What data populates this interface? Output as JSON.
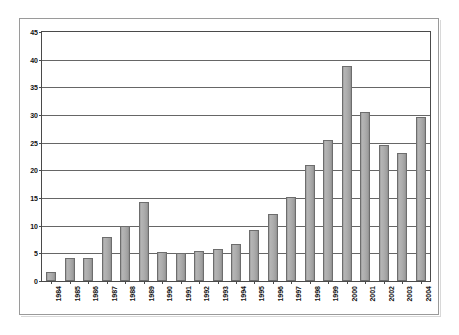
{
  "chart_data": {
    "type": "bar",
    "title": "",
    "subtitle": "",
    "xlabel": "",
    "ylabel": "",
    "categories": [
      "1984",
      "1985",
      "1986",
      "1987",
      "1988",
      "1989",
      "1990",
      "1991",
      "1992",
      "1993",
      "1994",
      "1995",
      "1996",
      "1997",
      "1998",
      "1999",
      "2000",
      "2001",
      "2002",
      "2003",
      "2004"
    ],
    "values": [
      1.6,
      4.2,
      4.1,
      7.9,
      10.0,
      14.2,
      5.2,
      5.0,
      5.5,
      5.7,
      6.6,
      9.2,
      12.1,
      15.1,
      21.0,
      25.5,
      38.9,
      30.6,
      24.6,
      23.2,
      29.7
    ],
    "ylim": [
      0,
      45
    ],
    "ytick_values": [
      0,
      5,
      10,
      15,
      20,
      25,
      30,
      35,
      40,
      45
    ],
    "ytick_labels": [
      "0",
      "5",
      "10",
      "15",
      "20",
      "25",
      "30",
      "35",
      "40",
      "45"
    ],
    "grid": true,
    "grid_axis": "y",
    "legend": false,
    "legend_position": "none",
    "series": [
      {
        "name": "",
        "values": [
          1.6,
          4.2,
          4.1,
          7.9,
          10.0,
          14.2,
          5.2,
          5.0,
          5.5,
          5.7,
          6.6,
          9.2,
          12.1,
          15.1,
          21.0,
          25.5,
          38.9,
          30.6,
          24.6,
          23.2,
          29.7
        ]
      }
    ],
    "colors": {
      "bar_fill": "#adadad",
      "bar_border": "#6d6d6d",
      "gridline": "#666666",
      "axis": "#4a4a4a",
      "frame": "#9a9a9a",
      "text": "#111111",
      "background": "#ffffff"
    }
  }
}
